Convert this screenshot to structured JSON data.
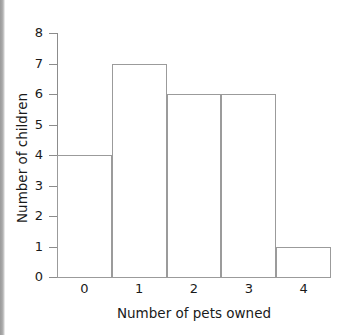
{
  "chart_data": {
    "type": "bar",
    "title": "",
    "subtitle": "",
    "xlabel": "Number of pets owned",
    "ylabel": "Number of children",
    "categories": [
      "0",
      "1",
      "2",
      "3",
      "4"
    ],
    "values": [
      4,
      7,
      6,
      6,
      1
    ],
    "ylim": [
      0,
      8
    ],
    "y_ticks": [
      "0",
      "1",
      "2",
      "3",
      "4",
      "5",
      "6",
      "7",
      "8"
    ],
    "y_tick_values": [
      0,
      1,
      2,
      3,
      4,
      5,
      6,
      7,
      8
    ],
    "grid": false,
    "legend": null,
    "annotations": [],
    "style": {
      "bar_fill": "#ffffff",
      "bar_stroke": "#9b9b9b",
      "axis_color": "#8c8c8c",
      "text_color": "#1a1a1a",
      "background": "#ffffff",
      "bars_adjacent": true
    }
  }
}
